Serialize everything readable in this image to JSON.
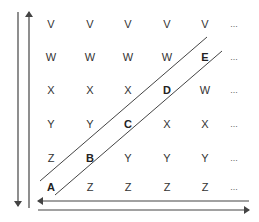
{
  "diagram": {
    "grid": {
      "columns_x": [
        51,
        90,
        128,
        167,
        205,
        234
      ],
      "rows_y": [
        24,
        57,
        90,
        124,
        158,
        187
      ],
      "rows": [
        [
          "V",
          "V",
          "V",
          "V",
          "V",
          "..."
        ],
        [
          "W",
          "W",
          "W",
          "W",
          "E",
          "..."
        ],
        [
          "X",
          "X",
          "X",
          "D",
          "W",
          "..."
        ],
        [
          "Y",
          "Y",
          "C",
          "X",
          "X",
          "..."
        ],
        [
          "Z",
          "B",
          "Y",
          "Y",
          "Y",
          "..."
        ],
        [
          "A",
          "Z",
          "Z",
          "Z",
          "Z",
          "..."
        ]
      ],
      "highlighted_diagonal": [
        "A",
        "B",
        "C",
        "D",
        "E"
      ]
    },
    "arrows": {
      "left_down": "vertical arrow pointing down",
      "left_up": "vertical arrow pointing up",
      "bottom_left": "horizontal arrow pointing left",
      "bottom_right": "horizontal arrow pointing right"
    },
    "colors": {
      "line": "#444444",
      "text": "#333333",
      "background": "#ffffff"
    }
  }
}
